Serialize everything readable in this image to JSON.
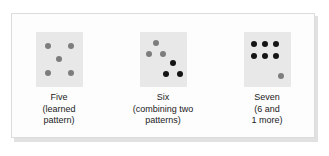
{
  "figure": {
    "background_color": "#ffffff",
    "panel_color": "#fdfdfd",
    "panel_border_color": "#dcdcdc",
    "shadow_color": "#c9c9c9",
    "die_face_color": "#e8e8e8",
    "dot_colors": {
      "gray": "#7d7d7d",
      "black": "#141414"
    }
  },
  "cards": [
    {
      "id": "five",
      "name": "Five",
      "caption_lines": [
        "Five",
        "(learned",
        "pattern)"
      ],
      "total_dots": 5,
      "dots": [
        {
          "color": "gray",
          "x": 9,
          "y": 11
        },
        {
          "color": "gray",
          "x": 32,
          "y": 11
        },
        {
          "color": "gray",
          "x": 20,
          "y": 24
        },
        {
          "color": "gray",
          "x": 9,
          "y": 38
        },
        {
          "color": "gray",
          "x": 32,
          "y": 38
        }
      ]
    },
    {
      "id": "six",
      "name": "Six",
      "caption_lines": [
        "Six",
        "(combining two",
        "patterns)"
      ],
      "total_dots": 6,
      "dots": [
        {
          "color": "gray",
          "x": 13,
          "y": 8
        },
        {
          "color": "gray",
          "x": 6,
          "y": 19
        },
        {
          "color": "gray",
          "x": 20,
          "y": 19
        },
        {
          "color": "black",
          "x": 30,
          "y": 28
        },
        {
          "color": "black",
          "x": 23,
          "y": 39
        },
        {
          "color": "black",
          "x": 37,
          "y": 39
        }
      ]
    },
    {
      "id": "seven",
      "name": "Seven",
      "caption_lines": [
        "Seven",
        "(6 and",
        "1 more)"
      ],
      "total_dots": 7,
      "dots": [
        {
          "color": "black",
          "x": 7,
          "y": 9
        },
        {
          "color": "black",
          "x": 18,
          "y": 9
        },
        {
          "color": "black",
          "x": 29,
          "y": 9
        },
        {
          "color": "black",
          "x": 7,
          "y": 21
        },
        {
          "color": "black",
          "x": 18,
          "y": 21
        },
        {
          "color": "black",
          "x": 29,
          "y": 21
        },
        {
          "color": "gray",
          "x": 34,
          "y": 41
        }
      ]
    }
  ]
}
